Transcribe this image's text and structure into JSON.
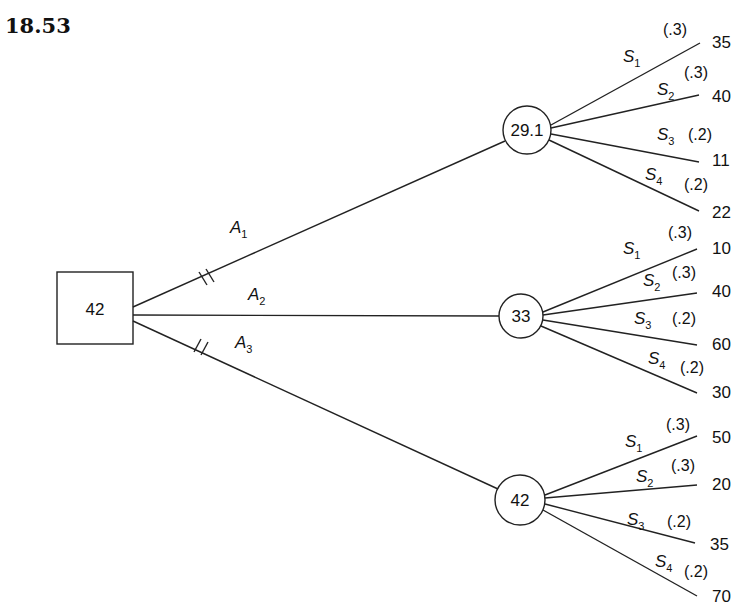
{
  "problem_number": "18.53",
  "decision_node": {
    "value": "42"
  },
  "alternatives": [
    {
      "label": "A",
      "sub": "1",
      "pruned": true,
      "chance_value": "29.1",
      "states": [
        {
          "label": "S",
          "sub": "1",
          "prob": "(.3)",
          "payoff": "35"
        },
        {
          "label": "S",
          "sub": "2",
          "prob": "(.3)",
          "payoff": "40"
        },
        {
          "label": "S",
          "sub": "3",
          "prob": "(.2)",
          "payoff": "11"
        },
        {
          "label": "S",
          "sub": "4",
          "prob": "(.2)",
          "payoff": "22"
        }
      ]
    },
    {
      "label": "A",
      "sub": "2",
      "pruned": false,
      "chance_value": "33",
      "states": [
        {
          "label": "S",
          "sub": "1",
          "prob": "(.3)",
          "payoff": "10"
        },
        {
          "label": "S",
          "sub": "2",
          "prob": "(.3)",
          "payoff": "40"
        },
        {
          "label": "S",
          "sub": "3",
          "prob": "(.2)",
          "payoff": "60"
        },
        {
          "label": "S",
          "sub": "4",
          "prob": "(.2)",
          "payoff": "30"
        }
      ]
    },
    {
      "label": "A",
      "sub": "3",
      "pruned": true,
      "chance_value": "42",
      "states": [
        {
          "label": "S",
          "sub": "1",
          "prob": "(.3)",
          "payoff": "50"
        },
        {
          "label": "S",
          "sub": "2",
          "prob": "(.3)",
          "payoff": "20"
        },
        {
          "label": "S",
          "sub": "3",
          "prob": "(.2)",
          "payoff": "35"
        },
        {
          "label": "S",
          "sub": "4",
          "prob": "(.2)",
          "payoff": "70"
        }
      ]
    }
  ]
}
